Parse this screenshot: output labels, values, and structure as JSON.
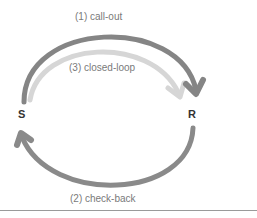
{
  "diagram": {
    "nodes": {
      "sender": "S",
      "receiver": "R"
    },
    "arrows": [
      {
        "id": "call-out",
        "label": "(1) call-out",
        "color": "#7f7f7f",
        "direction": "S->R"
      },
      {
        "id": "check-back",
        "label": "(2) check-back",
        "color": "#8a8a8a",
        "direction": "R->S"
      },
      {
        "id": "closed-loop",
        "label": "(3) closed-loop",
        "color": "#d4d4d4",
        "direction": "S->R"
      }
    ]
  }
}
